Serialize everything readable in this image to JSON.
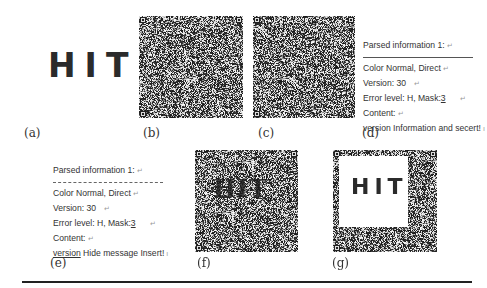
{
  "panels": {
    "a": {
      "label": "(a)",
      "image_text": "HIT"
    },
    "b": {
      "label": "(b)",
      "image": "qr-code-noise"
    },
    "c": {
      "label": "(c)",
      "image": "qr-code-noise"
    },
    "d": {
      "label": "(d)",
      "lines": {
        "title": "Parsed information 1:",
        "color": "Color Normal, Direct",
        "version": "Version: 30",
        "error_prefix": "Error level: H, Mask:",
        "error_mask": "3",
        "content": "Content:",
        "message": "version Information and secert!"
      }
    },
    "e": {
      "label": "(e)",
      "lines": {
        "title": "Parsed information 1:",
        "color": "Color Normal, Direct",
        "version": "Version: 30",
        "error_prefix": "Error level: H, Mask:",
        "error_mask": "3",
        "content": "Content:",
        "message_underlined": "version",
        "message_rest": " Hide message Insert!"
      }
    },
    "f": {
      "label": "(f)",
      "overlay_text": "HIT"
    },
    "g": {
      "label": "(g)",
      "image_text": "HIT"
    }
  },
  "marks": {
    "paragraph": "↵",
    "line_end": "ı"
  }
}
